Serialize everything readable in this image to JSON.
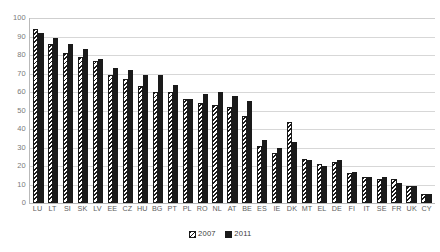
{
  "chart_data": {
    "type": "bar",
    "title": "",
    "subtitle": "",
    "xlabel": "",
    "ylabel": "",
    "ylim": [
      0,
      100
    ],
    "yticks": [
      0,
      10,
      20,
      30,
      40,
      50,
      60,
      70,
      80,
      90,
      100
    ],
    "grid": true,
    "legend_position": "bottom",
    "categories": [
      "LU",
      "LT",
      "SI",
      "SK",
      "LV",
      "EE",
      "CZ",
      "HU",
      "BG",
      "PT",
      "PL",
      "RO",
      "NL",
      "AT",
      "BE",
      "ES",
      "IE",
      "DK",
      "MT",
      "EL",
      "DE",
      "FI",
      "IT",
      "SE",
      "FR",
      "UK",
      "CY"
    ],
    "series": [
      {
        "name": "2007",
        "color": "#ffffff",
        "pattern": "diagonal-hatch",
        "values": [
          94,
          86,
          81,
          79,
          77,
          69,
          67,
          63,
          60,
          60,
          56,
          54,
          53,
          52,
          47,
          31,
          27,
          44,
          24,
          21,
          22,
          16,
          14,
          13,
          13,
          9,
          5
        ]
      },
      {
        "name": "2011",
        "color": "#1a1a1a",
        "pattern": "solid",
        "values": [
          92,
          89,
          86,
          83,
          78,
          73,
          72,
          69,
          69,
          64,
          56,
          59,
          60,
          58,
          55,
          34,
          30,
          33,
          23,
          20,
          23,
          17,
          14,
          14,
          11,
          9,
          5
        ]
      }
    ],
    "legend": [
      {
        "label": "2007",
        "swatch": "hatch-swatch"
      },
      {
        "label": "2011",
        "swatch": "solid-swatch"
      }
    ]
  }
}
